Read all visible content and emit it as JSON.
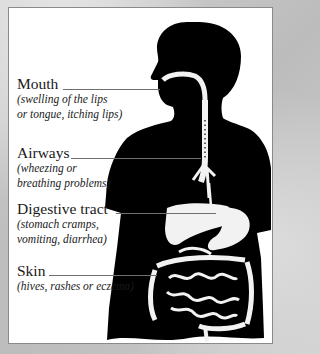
{
  "diagram": {
    "colors": {
      "background": "#c9c9c9",
      "panel": "#ffffff",
      "silhouette": "#000000",
      "organs": "#f2f2f2",
      "leader_line": "#6f6f6f",
      "text": "#1a1a1a"
    },
    "labels": [
      {
        "title": "Mouth",
        "description": "(swelling of the lips\nor tongue, itching lips)"
      },
      {
        "title": "Airways",
        "description": "(wheezing or\nbreathing problems)"
      },
      {
        "title": "Digestive tract",
        "description": "(stomach cramps,\nvomiting, diarrhea)"
      },
      {
        "title": "Skin",
        "description": "(hives, rashes or eczema)"
      }
    ]
  }
}
